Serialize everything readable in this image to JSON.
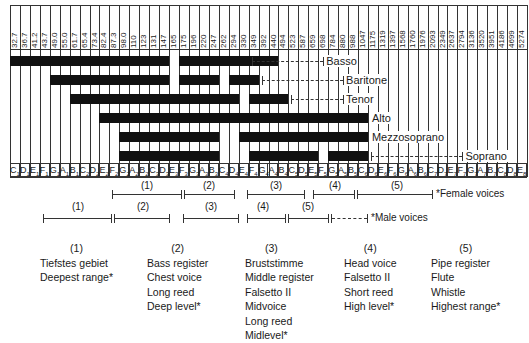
{
  "chart_data": {
    "type": "bar",
    "subtype": "range-bar (voice ranges on pitch axis)",
    "title": "",
    "xlabel": "Frequency (Hz) / Note",
    "ylabel": "",
    "frequency_ticks": [
      "32.7",
      "36.7",
      "41.2",
      "43.7",
      "49.0",
      "55.0",
      "61.7",
      "65.4",
      "73.4",
      "82.4",
      "87.3",
      "98.0",
      "110",
      "123",
      "131",
      "147",
      "165",
      "175",
      "196",
      "220",
      "247",
      "262",
      "294",
      "330",
      "349",
      "392",
      "440",
      "494",
      "523",
      "587",
      "659",
      "698",
      "784",
      "880",
      "988",
      "1047",
      "1175",
      "1319",
      "1397",
      "1568",
      "1760",
      "1976",
      "2093",
      "2349",
      "2637",
      "2794",
      "3136",
      "3520",
      "3951",
      "4186",
      "4699",
      "5274"
    ],
    "note_ticks": [
      "C1",
      "D1",
      "E1",
      "F1",
      "G1",
      "A1",
      "B1",
      "C2",
      "D2",
      "E2",
      "F2",
      "G2",
      "A2",
      "B2",
      "C3",
      "D3",
      "E3",
      "F3",
      "G3",
      "A3",
      "B3",
      "C4",
      "D4",
      "E4",
      "F4",
      "G4",
      "A4",
      "B4",
      "C5",
      "D5",
      "E5",
      "F5",
      "G5",
      "A5",
      "B5",
      "C6",
      "D6",
      "E6",
      "F6",
      "G6",
      "A6",
      "B6",
      "C7",
      "D7",
      "E7",
      "F7",
      "G7",
      "A7",
      "B7",
      "C8",
      "D8",
      "E8"
    ],
    "series": [
      {
        "name": "Basso",
        "segments": [
          [
            "C1",
            "D3"
          ],
          [
            "F3",
            "A4"
          ],
          [
            "C4",
            "E4"
          ]
        ],
        "extension": [
          "F4",
          "F5"
        ]
      },
      {
        "name": "Baritone",
        "segments": [
          [
            "G1",
            "D3"
          ],
          [
            "F3",
            "B3"
          ],
          [
            "D4",
            "F4"
          ]
        ],
        "extension": [
          "G4",
          "A5"
        ]
      },
      {
        "name": "Tenor",
        "segments": [
          [
            "B1",
            "F3"
          ],
          [
            "G3",
            "D4"
          ],
          [
            "F4",
            "B4"
          ]
        ],
        "extension": [
          "C5",
          "A5"
        ]
      },
      {
        "name": "Alto",
        "segments": [
          [
            "E2",
            "A4"
          ],
          [
            "C4",
            "C5"
          ],
          [
            "D5",
            "C6"
          ]
        ],
        "extension": null
      },
      {
        "name": "Mezzosoprano",
        "segments": [
          [
            "G2",
            "B3"
          ],
          [
            "E4",
            "D5"
          ],
          [
            "E5",
            "C6"
          ]
        ],
        "extension": null
      },
      {
        "name": "Soprano",
        "segments": [
          [
            "G2",
            "B3"
          ],
          [
            "F4",
            "E5"
          ],
          [
            "G5",
            "C6"
          ]
        ],
        "extension": [
          "D6",
          "F7"
        ]
      }
    ],
    "registers": {
      "female": [
        {
          "label": "(1)",
          "from": "A2",
          "to": "F3"
        },
        {
          "label": "(2)",
          "from": "F3",
          "to": "C4"
        },
        {
          "label": "(3)",
          "from": "D4",
          "to": "A4"
        },
        {
          "label": "(4)",
          "from": "B4",
          "to": "F5"
        },
        {
          "label": "(5)",
          "from": "F5",
          "to": "E6"
        }
      ],
      "male": [
        {
          "label": "(1)",
          "from": "E1",
          "to": "A2"
        },
        {
          "label": "(2)",
          "from": "A2",
          "to": "E3"
        },
        {
          "label": "(3)",
          "from": "F3",
          "to": "C4"
        },
        {
          "label": "(4)",
          "from": "D4",
          "to": "G4"
        },
        {
          "label": "(5)",
          "from": "G4",
          "to": "D5"
        }
      ]
    },
    "grid": true,
    "legend_position": "inline-right"
  },
  "voices": [
    "Basso",
    "Baritone",
    "Tenor",
    "Alto",
    "Mezzosoprano",
    "Soprano"
  ],
  "register_legend": {
    "female": "*Female voices",
    "male": "*Male voices"
  },
  "register_nums": [
    "(1)",
    "(2)",
    "(3)",
    "(4)",
    "(5)"
  ],
  "columns": [
    {
      "head": "(1)",
      "lines": [
        "Tiefstes gebiet",
        "Deepest range*"
      ]
    },
    {
      "head": "(2)",
      "lines": [
        "Bass register",
        "Chest voice",
        "Long reed",
        "Deep level*"
      ]
    },
    {
      "head": "(3)",
      "lines": [
        "Bruststimme",
        "Middle register",
        "Falsetto II",
        "Midvoice",
        "Long reed",
        "Midlevel*"
      ]
    },
    {
      "head": "(4)",
      "lines": [
        "Head voice",
        "Falsetto II",
        "Short reed",
        "High level*"
      ]
    },
    {
      "head": "(5)",
      "lines": [
        "Pipe register",
        "Flute",
        "Whistle",
        "Highest range*"
      ]
    }
  ]
}
